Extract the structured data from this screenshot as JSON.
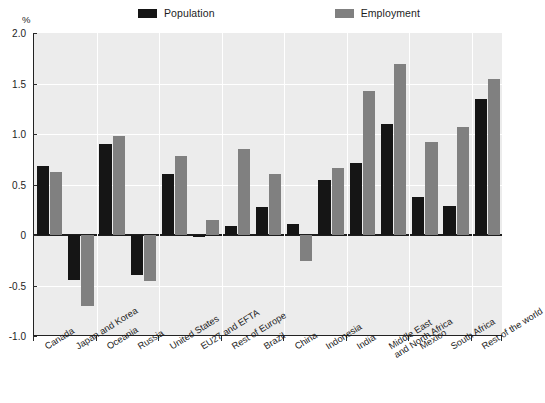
{
  "chart_data": {
    "type": "bar",
    "title": "",
    "subtitle": "",
    "xlabel": "",
    "ylabel": "%",
    "ylim": [
      -1.0,
      2.0
    ],
    "yticks": [
      "2.0",
      "1.5",
      "1.0",
      "0.5",
      "0",
      "-0.5",
      "-1.0"
    ],
    "ytick_values": [
      2.0,
      1.5,
      1.0,
      0.5,
      0,
      -0.5,
      -1.0
    ],
    "grid": true,
    "legend_position": "top",
    "categories": [
      "Canada",
      "Japan and Korea",
      "Oceania",
      "Russia",
      "United States",
      "EU27 and EFTA",
      "Rest of Europe",
      "Brazil",
      "China",
      "Indonesia",
      "India",
      "Middle East\nand North Africa",
      "Mexico",
      "South Africa",
      "Rest of the world"
    ],
    "series": [
      {
        "name": "Population",
        "color": "#151515",
        "values": [
          0.68,
          -0.45,
          0.9,
          -0.4,
          0.6,
          -0.02,
          0.09,
          0.28,
          0.11,
          0.54,
          0.71,
          1.1,
          0.38,
          0.29,
          1.35
        ]
      },
      {
        "name": "Employment",
        "color": "#808080",
        "values": [
          0.62,
          -0.7,
          0.98,
          -0.46,
          0.78,
          0.15,
          0.85,
          0.6,
          -0.26,
          0.66,
          1.43,
          1.69,
          0.92,
          1.07,
          1.54
        ]
      }
    ]
  },
  "legend": {
    "entries": [
      {
        "label": "Population",
        "color": "#151515"
      },
      {
        "label": "Employment",
        "color": "#808080"
      }
    ]
  },
  "axis": {
    "unit_label": "%"
  }
}
